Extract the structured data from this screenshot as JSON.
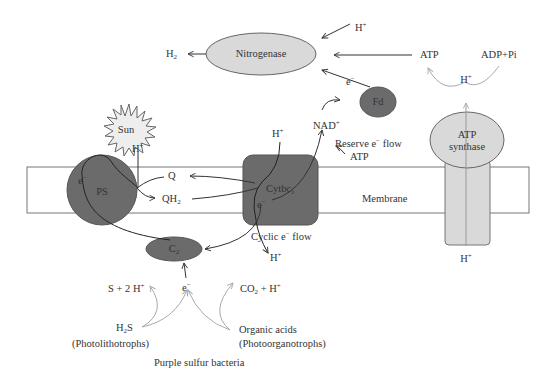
{
  "diagram": {
    "title": "Purple sulfur bacteria",
    "colors": {
      "dark_protein": "#6b6b6b",
      "light_protein": "#d9d9d9",
      "membrane_fill": "#ffffff",
      "membrane_stroke": "#777777",
      "arrow_dark": "#333333",
      "arrow_light": "#b5b5b5",
      "sun_fill": "#eeeeee"
    },
    "nodes": {
      "sun": "Sun",
      "ps": "PS",
      "cytbc1": "Cytbc",
      "cytbc1_sub": "1",
      "c2": "C",
      "c2_sub": "2",
      "fd": "Fd",
      "nitrogenase": "Nitrogenase",
      "atp_synthase_line1": "ATP",
      "atp_synthase_line2": "synthase",
      "membrane": "Membrane"
    },
    "labels": {
      "h_plus_top": "H",
      "h2": "H",
      "h2_sub": "2",
      "e_minus_fd": "e",
      "nad_plus": "NAD",
      "reserve_flow": "Reserve e",
      "reserve_flow_suffix": " flow",
      "atp_reserve": "ATP",
      "atp_top": "ATP",
      "adp_pi": "ADP+Pi",
      "h_plus_atp_arc": "H",
      "h_plus_ps": "H",
      "e_minus_ps": "e",
      "q": "Q",
      "qh2": "QH",
      "qh2_sub": "2",
      "h_plus_cyt": "H",
      "e_minus_cyt": "e",
      "cyclic_flow": "Cyclic e",
      "cyclic_flow_suffix": " flow",
      "h_plus_cyt_out": "H",
      "h_plus_atp_bottom": "H",
      "s_2h": "S + 2 H",
      "e_minus_c2": "e",
      "co2_h": "CO",
      "co2_sub": "2",
      "co2_suffix": " + H",
      "h2s": "H",
      "h2s_sub": "2",
      "h2s_suffix": "S",
      "photolithotrophs": "(Photolithotrophs)",
      "organic_acids": "Organic acids",
      "photoorganotrophs": "(Photoorganotrophs)",
      "plus": "+",
      "minus": "−"
    }
  }
}
